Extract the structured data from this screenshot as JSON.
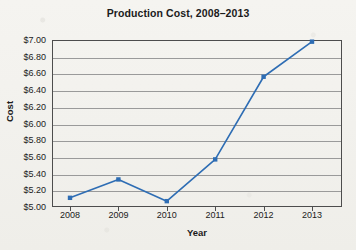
{
  "chart_data": {
    "type": "line",
    "title": "Production Cost, 2008–2013",
    "xlabel": "Year",
    "ylabel": "Cost",
    "categories": [
      "2008",
      "2009",
      "2010",
      "2011",
      "2012",
      "2013"
    ],
    "x": [
      2008,
      2009,
      2010,
      2011,
      2012,
      2013
    ],
    "values": [
      5.11,
      5.33,
      5.07,
      5.57,
      6.56,
      6.98
    ],
    "series": [
      {
        "name": "Production Cost",
        "values": [
          5.11,
          5.33,
          5.07,
          5.57,
          6.56,
          6.98
        ]
      }
    ],
    "ylim": [
      5.0,
      7.0
    ],
    "ytick_step": 0.2,
    "ytick_labels": [
      "$5.00",
      "$5.20",
      "$5.40",
      "$5.60",
      "$5.80",
      "$6.00",
      "$6.20",
      "$6.40",
      "$6.60",
      "$6.80",
      "$7.00"
    ],
    "ytick_values": [
      5.0,
      5.2,
      5.4,
      5.6,
      5.8,
      6.0,
      6.2,
      6.4,
      6.6,
      6.8,
      7.0
    ],
    "xtick_labels": [
      "2008",
      "2009",
      "2010",
      "2011",
      "2012",
      "2013"
    ],
    "grid": "horizontal",
    "legend": "none",
    "marker": "square",
    "colors": {
      "series_line": "#2E6DB4",
      "series_marker": "#2E6DB4",
      "gridline": "#9A9A9A",
      "axis": "#4D4D4D",
      "text": "#1B1B1B",
      "background": "#F3F2EE"
    }
  }
}
